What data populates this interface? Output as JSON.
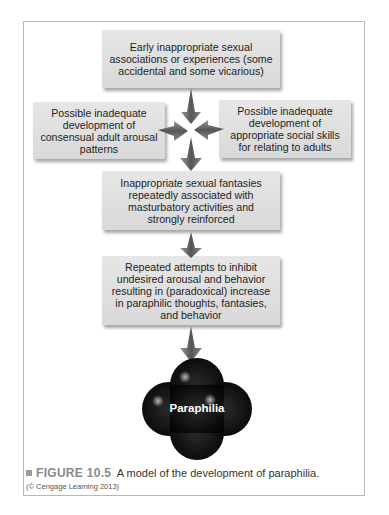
{
  "diagram": {
    "boxes": [
      {
        "id": "early",
        "text": "Early inappropriate sexual associations or experiences (some accidental and some vicarious)"
      },
      {
        "id": "left",
        "text": "Possible inadequate development of consensual adult arousal patterns"
      },
      {
        "id": "right",
        "text": "Possible inadequate development of appropriate social skills for relating to adults"
      },
      {
        "id": "fantasies",
        "text": "Inappropriate sexual fantasies repeatedly associated with masturbatory activities and strongly reinforced"
      },
      {
        "id": "inhibit",
        "text": "Repeated attempts to inhibit undesired arousal and behavior resulting in (paradoxical) increase in paraphilic thoughts, fantasies, and behavior"
      }
    ],
    "outcome": "Paraphilia",
    "connections": [
      {
        "from": "early",
        "to": "fantasies"
      },
      {
        "from": "left",
        "to": "fantasies"
      },
      {
        "from": "right",
        "to": "fantasies"
      },
      {
        "from": "fantasies",
        "to": "inhibit"
      },
      {
        "from": "inhibit",
        "to": "outcome"
      }
    ],
    "colors": {
      "box_fill": "#dedede",
      "arrow": "#6e6e6e",
      "outcome_fill": "#0c0c0c",
      "frame": "#b8b8b8"
    }
  },
  "caption": {
    "figure_label": "FIGURE 10.5",
    "text": "A model of the development of paraphilia.",
    "credit": "(© Cengage Learning 2013)"
  }
}
